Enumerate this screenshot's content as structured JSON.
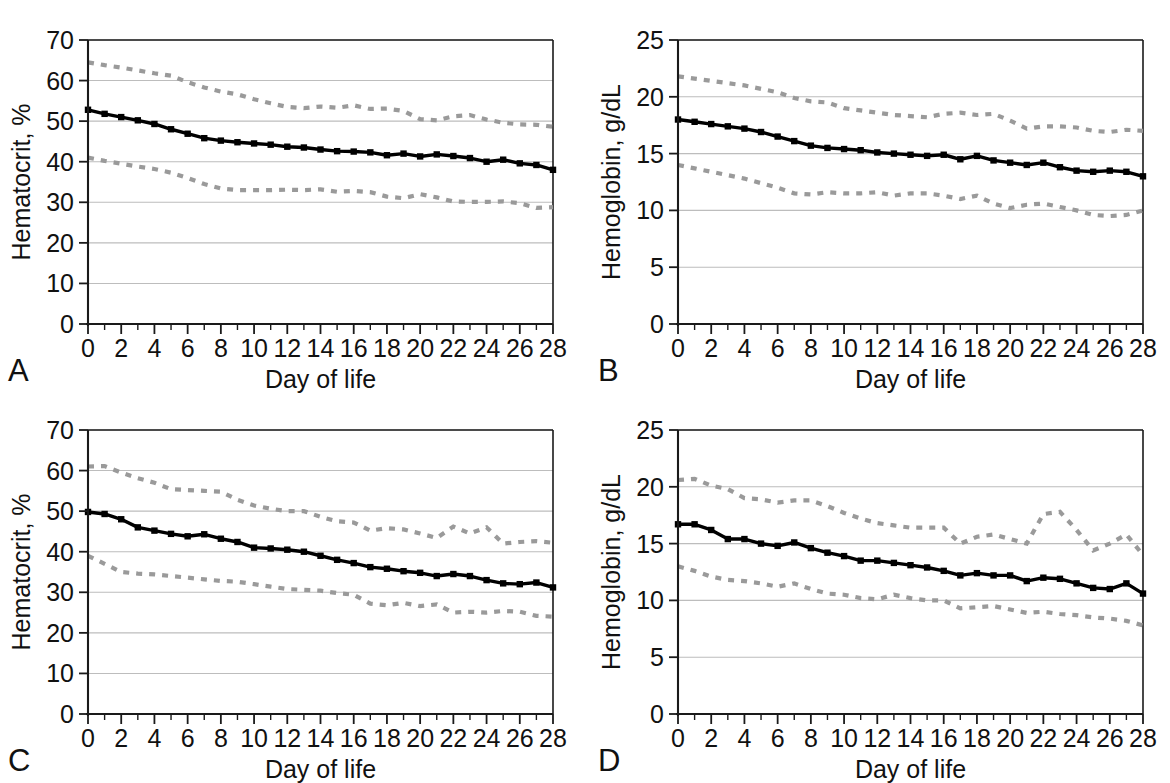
{
  "figure": {
    "panels": [
      {
        "letter": "A",
        "ylabel": "Hematocrit, %",
        "xlabel": "Day of life"
      },
      {
        "letter": "B",
        "ylabel": "Hemoglobin, g/dL",
        "xlabel": "Day of life"
      },
      {
        "letter": "C",
        "ylabel": "Hematocrit, %",
        "xlabel": "Day of life"
      },
      {
        "letter": "D",
        "ylabel": "Hemoglobin, g/dL",
        "xlabel": "Day of life"
      }
    ]
  },
  "chart_data": [
    {
      "id": "panel-a",
      "type": "line",
      "title": "",
      "panel_letter": "A",
      "xlabel": "Day of life",
      "ylabel": "Hematocrit, %",
      "xlim": [
        0,
        28
      ],
      "ylim": [
        0,
        70
      ],
      "ytick_labels": [
        "0",
        "10",
        "20",
        "30",
        "40",
        "50",
        "60",
        "70"
      ],
      "yticks": [
        0,
        10,
        20,
        30,
        40,
        50,
        60,
        70
      ],
      "xtick_labels": [
        "0",
        "2",
        "4",
        "6",
        "8",
        "10",
        "12",
        "14",
        "16",
        "18",
        "20",
        "22",
        "24",
        "26",
        "28"
      ],
      "xticks": [
        0,
        2,
        4,
        6,
        8,
        10,
        12,
        14,
        16,
        18,
        20,
        22,
        24,
        26,
        28
      ],
      "x_minor_ticks": [
        1,
        3,
        5,
        7,
        9,
        11,
        13,
        15,
        17,
        19,
        21,
        23,
        25,
        27
      ],
      "grid": "horizontal",
      "legend": "none",
      "x": [
        0,
        1,
        2,
        3,
        4,
        5,
        6,
        7,
        8,
        9,
        10,
        11,
        12,
        13,
        14,
        15,
        16,
        17,
        18,
        19,
        20,
        21,
        22,
        23,
        24,
        25,
        26,
        27,
        28
      ],
      "series": [
        {
          "name": "upper percentile",
          "style": "dashed",
          "color": "#9a9a9a",
          "markers": false,
          "values": [
            64.5,
            63.8,
            63.2,
            62.5,
            61.8,
            61.2,
            59.6,
            58.3,
            57.3,
            56.6,
            55.4,
            54.4,
            53.5,
            53.2,
            53.6,
            53.3,
            53.9,
            53.0,
            53.1,
            52.5,
            50.5,
            50.2,
            51.2,
            51.5,
            50.4,
            49.6,
            49.2,
            49.1,
            48.6
          ]
        },
        {
          "name": "median",
          "style": "solid",
          "color": "#000000",
          "markers": true,
          "values": [
            52.8,
            51.8,
            51.0,
            50.2,
            49.3,
            48.0,
            46.9,
            45.8,
            45.2,
            44.8,
            44.5,
            44.2,
            43.7,
            43.5,
            43.0,
            42.6,
            42.5,
            42.3,
            41.6,
            42.0,
            41.3,
            41.8,
            41.4,
            40.9,
            40.0,
            40.5,
            39.6,
            39.2,
            38.0
          ]
        },
        {
          "name": "lower percentile",
          "style": "dashed",
          "color": "#9a9a9a",
          "markers": false,
          "values": [
            41.0,
            40.2,
            39.5,
            38.8,
            38.2,
            37.3,
            36.0,
            34.5,
            33.4,
            33.0,
            33.0,
            33.0,
            33.1,
            33.0,
            33.2,
            32.6,
            32.8,
            32.5,
            31.4,
            31.0,
            32.0,
            31.2,
            30.2,
            30.1,
            30.1,
            30.2,
            29.8,
            28.6,
            28.8
          ]
        }
      ]
    },
    {
      "id": "panel-b",
      "type": "line",
      "title": "",
      "panel_letter": "B",
      "xlabel": "Day of life",
      "ylabel": "Hemoglobin, g/dL",
      "xlim": [
        0,
        28
      ],
      "ylim": [
        0,
        25
      ],
      "ytick_labels": [
        "0",
        "5",
        "10",
        "15",
        "20",
        "25"
      ],
      "yticks": [
        0,
        5,
        10,
        15,
        20,
        25
      ],
      "xtick_labels": [
        "0",
        "2",
        "4",
        "6",
        "8",
        "10",
        "12",
        "14",
        "16",
        "18",
        "20",
        "22",
        "24",
        "26",
        "28"
      ],
      "xticks": [
        0,
        2,
        4,
        6,
        8,
        10,
        12,
        14,
        16,
        18,
        20,
        22,
        24,
        26,
        28
      ],
      "x_minor_ticks": [
        1,
        3,
        5,
        7,
        9,
        11,
        13,
        15,
        17,
        19,
        21,
        23,
        25,
        27
      ],
      "grid": "horizontal",
      "legend": "none",
      "x": [
        0,
        1,
        2,
        3,
        4,
        5,
        6,
        7,
        8,
        9,
        10,
        11,
        12,
        13,
        14,
        15,
        16,
        17,
        18,
        19,
        20,
        21,
        22,
        23,
        24,
        25,
        26,
        27,
        28
      ],
      "series": [
        {
          "name": "upper percentile",
          "style": "dashed",
          "color": "#9a9a9a",
          "markers": false,
          "values": [
            21.8,
            21.6,
            21.4,
            21.2,
            21.0,
            20.7,
            20.4,
            19.9,
            19.6,
            19.5,
            19.0,
            18.8,
            18.6,
            18.4,
            18.3,
            18.2,
            18.5,
            18.6,
            18.4,
            18.5,
            17.9,
            17.2,
            17.4,
            17.4,
            17.3,
            17.0,
            16.9,
            17.1,
            17.0
          ]
        },
        {
          "name": "median",
          "style": "solid",
          "color": "#000000",
          "markers": true,
          "values": [
            18.0,
            17.8,
            17.6,
            17.4,
            17.2,
            16.9,
            16.5,
            16.1,
            15.7,
            15.5,
            15.4,
            15.3,
            15.1,
            15.0,
            14.9,
            14.8,
            14.9,
            14.5,
            14.8,
            14.4,
            14.2,
            14.0,
            14.2,
            13.8,
            13.5,
            13.4,
            13.5,
            13.4,
            13.0
          ]
        },
        {
          "name": "lower percentile",
          "style": "dashed",
          "color": "#9a9a9a",
          "markers": false,
          "values": [
            14.0,
            13.7,
            13.4,
            13.1,
            12.8,
            12.4,
            12.0,
            11.5,
            11.4,
            11.6,
            11.5,
            11.5,
            11.6,
            11.3,
            11.5,
            11.5,
            11.3,
            11.0,
            11.3,
            10.6,
            10.2,
            10.5,
            10.6,
            10.3,
            10.0,
            9.6,
            9.5,
            9.6,
            10.0
          ]
        }
      ]
    },
    {
      "id": "panel-c",
      "type": "line",
      "title": "",
      "panel_letter": "C",
      "xlabel": "Day of life",
      "ylabel": "Hematocrit, %",
      "xlim": [
        0,
        28
      ],
      "ylim": [
        0,
        70
      ],
      "ytick_labels": [
        "0",
        "10",
        "20",
        "30",
        "40",
        "50",
        "60",
        "70"
      ],
      "yticks": [
        0,
        10,
        20,
        30,
        40,
        50,
        60,
        70
      ],
      "xtick_labels": [
        "0",
        "2",
        "4",
        "6",
        "8",
        "10",
        "12",
        "14",
        "16",
        "18",
        "20",
        "22",
        "24",
        "26",
        "28"
      ],
      "xticks": [
        0,
        2,
        4,
        6,
        8,
        10,
        12,
        14,
        16,
        18,
        20,
        22,
        24,
        26,
        28
      ],
      "x_minor_ticks": [
        1,
        3,
        5,
        7,
        9,
        11,
        13,
        15,
        17,
        19,
        21,
        23,
        25,
        27
      ],
      "grid": "horizontal",
      "legend": "none",
      "x": [
        0,
        1,
        2,
        3,
        4,
        5,
        6,
        7,
        8,
        9,
        10,
        11,
        12,
        13,
        14,
        15,
        16,
        17,
        18,
        19,
        20,
        21,
        22,
        23,
        24,
        25,
        26,
        27,
        28
      ],
      "series": [
        {
          "name": "upper percentile",
          "style": "dashed",
          "color": "#9a9a9a",
          "markers": false,
          "values": [
            61.0,
            61.1,
            59.5,
            58.1,
            57.0,
            55.4,
            55.2,
            55.0,
            54.8,
            52.8,
            51.4,
            50.6,
            50.0,
            50.0,
            48.6,
            47.5,
            47.2,
            45.2,
            45.8,
            45.5,
            44.5,
            43.4,
            46.2,
            44.5,
            46.0,
            42.0,
            42.4,
            42.6,
            42.2
          ]
        },
        {
          "name": "median",
          "style": "solid",
          "color": "#000000",
          "markers": true,
          "values": [
            49.8,
            49.3,
            48.0,
            46.0,
            45.2,
            44.4,
            43.8,
            44.3,
            43.2,
            42.4,
            41.0,
            40.8,
            40.5,
            40.0,
            39.0,
            38.0,
            37.2,
            36.2,
            35.8,
            35.2,
            34.8,
            34.0,
            34.5,
            34.0,
            33.0,
            32.2,
            32.0,
            32.4,
            31.2
          ]
        },
        {
          "name": "lower percentile",
          "style": "dashed",
          "color": "#9a9a9a",
          "markers": false,
          "values": [
            39.0,
            37.0,
            35.0,
            34.6,
            34.4,
            34.0,
            33.6,
            33.2,
            32.8,
            32.6,
            32.0,
            31.4,
            30.8,
            30.6,
            30.4,
            29.8,
            29.4,
            27.2,
            26.8,
            27.4,
            26.6,
            27.0,
            25.0,
            25.2,
            25.0,
            25.4,
            25.2,
            24.2,
            24.0
          ]
        }
      ]
    },
    {
      "id": "panel-d",
      "type": "line",
      "title": "",
      "panel_letter": "D",
      "xlabel": "Day of life",
      "ylabel": "Hemoglobin, g/dL",
      "xlim": [
        0,
        28
      ],
      "ylim": [
        0,
        25
      ],
      "ytick_labels": [
        "0",
        "5",
        "10",
        "15",
        "20",
        "25"
      ],
      "yticks": [
        0,
        5,
        10,
        15,
        20,
        25
      ],
      "xtick_labels": [
        "0",
        "2",
        "4",
        "6",
        "8",
        "10",
        "12",
        "14",
        "16",
        "18",
        "20",
        "22",
        "24",
        "26",
        "28"
      ],
      "xticks": [
        0,
        2,
        4,
        6,
        8,
        10,
        12,
        14,
        16,
        18,
        20,
        22,
        24,
        26,
        28
      ],
      "x_minor_ticks": [
        1,
        3,
        5,
        7,
        9,
        11,
        13,
        15,
        17,
        19,
        21,
        23,
        25,
        27
      ],
      "grid": "horizontal",
      "legend": "none",
      "x": [
        0,
        1,
        2,
        3,
        4,
        5,
        6,
        7,
        8,
        9,
        10,
        11,
        12,
        13,
        14,
        15,
        16,
        17,
        18,
        19,
        20,
        21,
        22,
        23,
        24,
        25,
        26,
        27,
        28
      ],
      "series": [
        {
          "name": "upper percentile",
          "style": "dashed",
          "color": "#9a9a9a",
          "markers": false,
          "values": [
            20.6,
            20.7,
            20.1,
            19.8,
            19.0,
            18.9,
            18.6,
            18.8,
            18.8,
            18.3,
            17.7,
            17.2,
            16.8,
            16.6,
            16.4,
            16.4,
            16.4,
            15.0,
            15.6,
            15.8,
            15.4,
            15.0,
            17.6,
            17.8,
            16.2,
            14.4,
            15.0,
            15.8,
            14.0
          ]
        },
        {
          "name": "median",
          "style": "solid",
          "color": "#000000",
          "markers": true,
          "values": [
            16.7,
            16.7,
            16.2,
            15.4,
            15.4,
            15.0,
            14.8,
            15.1,
            14.6,
            14.2,
            13.9,
            13.5,
            13.5,
            13.3,
            13.1,
            12.9,
            12.6,
            12.2,
            12.4,
            12.2,
            12.2,
            11.7,
            12.0,
            11.9,
            11.5,
            11.1,
            11.0,
            11.5,
            10.6
          ]
        },
        {
          "name": "lower percentile",
          "style": "dashed",
          "color": "#9a9a9a",
          "markers": false,
          "values": [
            13.0,
            12.6,
            12.1,
            11.8,
            11.7,
            11.5,
            11.2,
            11.5,
            11.0,
            10.6,
            10.5,
            10.2,
            10.1,
            10.5,
            10.2,
            10.0,
            10.0,
            9.3,
            9.4,
            9.5,
            9.2,
            8.9,
            9.0,
            8.8,
            8.7,
            8.5,
            8.4,
            8.2,
            7.8
          ]
        }
      ]
    }
  ]
}
